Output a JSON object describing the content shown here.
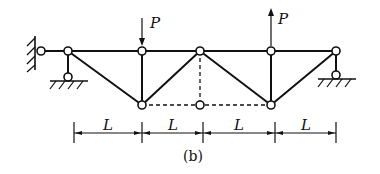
{
  "figure": {
    "caption": "(b)",
    "load_label_down": "P",
    "load_label_up": "P",
    "dimensions": [
      "L",
      "L",
      "L",
      "L"
    ]
  },
  "structure": {
    "type": "truss",
    "members_solid": "top chord, diagonals, verticals",
    "members_dashed": "bottom chord between lower nodes and vertical at center",
    "supports": [
      "fixed pin at left wall",
      "roller support under left node",
      "roller support under right node"
    ],
    "loads": [
      {
        "label": "P",
        "direction": "down",
        "node": "top node 2"
      },
      {
        "label": "P",
        "direction": "up",
        "node": "top node 4"
      }
    ]
  }
}
